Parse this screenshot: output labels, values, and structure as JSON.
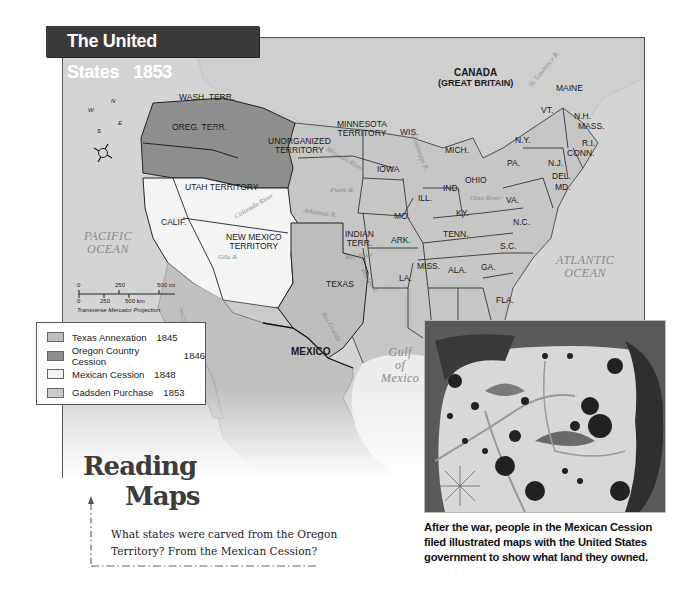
{
  "title": {
    "text": "The United States",
    "year": "1853"
  },
  "map": {
    "regions": {
      "canada": {
        "line1": "CANADA",
        "line2": "(GREAT BRITAIN)"
      },
      "mexico": "MEXICO",
      "territories": [
        {
          "id": "wash",
          "label": "WASH. TERR."
        },
        {
          "id": "oreg",
          "label": "OREG. TERR."
        },
        {
          "id": "unorganized",
          "line1": "UNORGANIZED",
          "line2": "TERRITORY"
        },
        {
          "id": "minnesota",
          "line1": "MINNESOTA",
          "line2": "TERRITORY"
        },
        {
          "id": "utah",
          "label": "UTAH TERRITORY"
        },
        {
          "id": "newmexico",
          "line1": "NEW MEXICO",
          "line2": "TERRITORY"
        },
        {
          "id": "indian",
          "line1": "INDIAN",
          "line2": "TERR."
        }
      ],
      "states": {
        "calif": "CALIF.",
        "texas": "TEXAS",
        "wis": "WIS.",
        "iowa": "IOWA",
        "mich": "MICH.",
        "ill": "ILL.",
        "ind": "IND.",
        "ohio": "OHIO",
        "mo": "MO.",
        "ky": "KY.",
        "ark": "ARK.",
        "tenn": "TENN.",
        "la": "LA.",
        "miss": "MISS.",
        "ala": "ALA.",
        "ga": "GA.",
        "fla": "FLA.",
        "sc": "S.C.",
        "nc": "N.C.",
        "va": "VA.",
        "pa": "PA.",
        "ny": "N.Y.",
        "nj": "N.J.",
        "del": "DEL.",
        "md": "MD.",
        "vt": "VT.",
        "nh": "N.H.",
        "mass": "MASS.",
        "ri": "R.I.",
        "conn": "CONN.",
        "maine": "MAINE"
      }
    },
    "water": {
      "pacific": {
        "line1": "PACIFIC",
        "line2": "OCEAN"
      },
      "atlantic": {
        "line1": "ATLANTIC",
        "line2": "OCEAN"
      },
      "gulf": {
        "line1": "Gulf",
        "line2": "of",
        "line3": "Mexico"
      }
    },
    "rivers": {
      "snake": "Snake River",
      "missouri": "Missouri River",
      "platte": "Platte R.",
      "arkansas": "Arkansas R.",
      "colorado": "Colorado River",
      "gila": "Gila R.",
      "red": "Red River",
      "brazos": "Brazos R.",
      "rio_grande": "Rio Grande",
      "st_lawrence": "St. Lawrence R.",
      "mississippi": "Mississippi R.",
      "ohio": "Ohio River"
    },
    "compass": {
      "n": "N",
      "e": "E",
      "s": "S",
      "w": "W"
    },
    "scale": {
      "mi_ticks": [
        "0",
        "250",
        "500 mi"
      ],
      "km_ticks": [
        "0",
        "250",
        "500 km"
      ],
      "projection": "Transverse Mercator Projection"
    }
  },
  "legend": {
    "items": [
      {
        "label": "Texas Annexation",
        "year": "1845",
        "color": "#bdbdbd"
      },
      {
        "label": "Oregon Country Cession",
        "year": "1846",
        "color": "#8e8e8e"
      },
      {
        "label": "Mexican Cession",
        "year": "1848",
        "color": "#f4f4f4"
      },
      {
        "label": "Gadsden Purchase",
        "year": "1853",
        "color": "#cbcbcb"
      }
    ]
  },
  "reading_maps": {
    "heading_line1": "Reading",
    "heading_line2": "Maps",
    "question": "What states were carved from the Oregon Territory? From the Mexican Cession?"
  },
  "inset": {
    "caption": "After the war, people in the Mexican Cession filed illustrated maps with the United States government to show what land they owned."
  },
  "colors": {
    "title_bar": "#3a3a3a",
    "background_land": "#c4c4c4",
    "water": "#d6d6d6",
    "oregon": "#8e8e8e",
    "mexican_cession": "#f4f4f4",
    "texas": "#bdbdbd"
  }
}
